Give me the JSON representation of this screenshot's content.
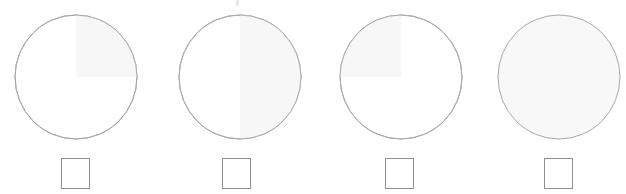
{
  "canvas": {
    "width": 626,
    "height": 194,
    "background_color": "#ffffff",
    "title": "Four outlined circles with faint shaded sectors and squares below"
  },
  "style": {
    "circle_stroke_color": "#a8a8ad",
    "circle_stroke_width": 1,
    "circle_base_fill": "#ffffff",
    "shade_color": "#f7f7f8",
    "shade_color_strong": "#f4f4f6",
    "square_stroke_color": "#8f8f93",
    "square_fill": "#ffffff"
  },
  "artifact": {
    "name": "top-edge-mark",
    "x": 236,
    "y": 0,
    "width": 3,
    "height": 6,
    "color": "#e9e9ec"
  },
  "figures": [
    {
      "id": "figure-1",
      "index": 1,
      "group_left": 15,
      "circle": {
        "center_x": 61,
        "center_y": 63,
        "radius_x": 61,
        "radius_y": 62,
        "shade_pattern": "upper-right-quadrant",
        "shade_label": "Upper right quadrant shaded",
        "fill_color": "#ffffff",
        "shade_color": "#f7f7f8",
        "stroke_color": "#a8a8ad"
      },
      "square": {
        "x": 46,
        "y": 158,
        "width": 29,
        "height": 31,
        "fill_color": "#ffffff",
        "stroke_color": "#8f8f93"
      }
    },
    {
      "id": "figure-2",
      "index": 2,
      "group_left": 175,
      "circle": {
        "center_x": 65,
        "center_y": 63,
        "radius_x": 61,
        "radius_y": 62,
        "shade_pattern": "right-half",
        "shade_label": "Right half shaded",
        "fill_color": "#ffffff",
        "shade_color": "#f7f7f8",
        "stroke_color": "#a8a8ad"
      },
      "square": {
        "x": 47,
        "y": 158,
        "width": 29,
        "height": 31,
        "fill_color": "#ffffff",
        "stroke_color": "#8f8f93"
      }
    },
    {
      "id": "figure-3",
      "index": 3,
      "group_left": 339,
      "circle": {
        "center_x": 62,
        "center_y": 63,
        "radius_x": 61,
        "radius_y": 62,
        "shade_pattern": "upper-left-quadrant",
        "shade_label": "Upper left quadrant shaded",
        "fill_color": "#ffffff",
        "shade_color": "#f7f7f8",
        "stroke_color": "#a8a8ad"
      },
      "square": {
        "x": 46,
        "y": 158,
        "width": 29,
        "height": 31,
        "fill_color": "#ffffff",
        "stroke_color": "#8f8f93"
      }
    },
    {
      "id": "figure-4",
      "index": 4,
      "group_left": 497,
      "circle": {
        "center_x": 62,
        "center_y": 63,
        "radius_x": 61,
        "radius_y": 62,
        "shade_pattern": "full",
        "shade_label": "Entire circle shaded",
        "fill_color": "#f8f8f9",
        "shade_color": "#f8f8f9",
        "stroke_color": "#a8a8ad"
      },
      "square": {
        "x": 47,
        "y": 158,
        "width": 29,
        "height": 31,
        "fill_color": "#ffffff",
        "stroke_color": "#8f8f93"
      }
    }
  ]
}
